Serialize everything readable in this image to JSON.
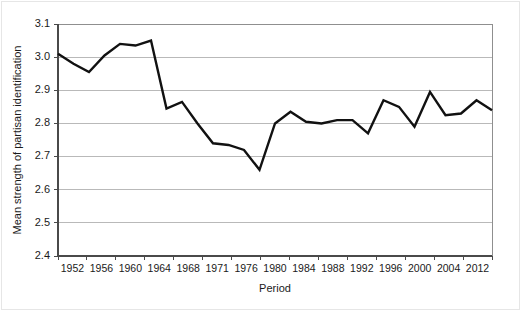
{
  "chart_data": {
    "type": "line",
    "title": "",
    "xlabel": "Period",
    "ylabel": "Mean strength of partisan identification",
    "ylim": [
      2.4,
      3.1
    ],
    "yticks": [
      2.4,
      2.5,
      2.6,
      2.7,
      2.8,
      2.9,
      3.0,
      3.1
    ],
    "ytick_labels": [
      "2.4",
      "2.5",
      "2.6",
      "2.7",
      "2.8",
      "2.9",
      "3.0",
      "3.1"
    ],
    "grid": true,
    "legend": "none",
    "xtick_labels": [
      "1952",
      "1956",
      "1960",
      "1964",
      "1968",
      "1971",
      "1976",
      "1980",
      "1984",
      "1988",
      "1992",
      "1996",
      "2000",
      "2004",
      "2012"
    ],
    "x": [
      1952,
      1954,
      1956,
      1958,
      1960,
      1962,
      1964,
      1966,
      1968,
      1970,
      1971,
      1974,
      1976,
      1978,
      1980,
      1982,
      1984,
      1986,
      1988,
      1990,
      1992,
      1994,
      1996,
      1998,
      2000,
      2002,
      2004,
      2008,
      2012
    ],
    "values": [
      3.01,
      2.98,
      2.955,
      3.005,
      3.04,
      3.035,
      3.05,
      2.845,
      2.865,
      2.8,
      2.74,
      2.735,
      2.72,
      2.66,
      2.8,
      2.835,
      2.805,
      2.8,
      2.81,
      2.81,
      2.77,
      2.87,
      2.85,
      2.79,
      2.895,
      2.825,
      2.83,
      2.87,
      2.84
    ],
    "series_name": "Mean strength of partisan identification",
    "line_color": "#111111",
    "grid_color": "#b9b9b9",
    "axis_color": "#4a4a4a",
    "min_value": 2.66,
    "max_value": 3.05
  }
}
